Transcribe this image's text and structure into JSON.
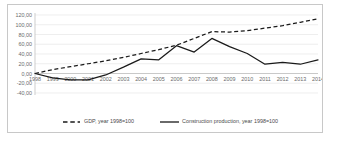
{
  "chart_data": {
    "type": "line",
    "title": "",
    "xlabel": "",
    "ylabel": "",
    "grid": true,
    "legend_position": "bottom",
    "ylim": [
      -40,
      120
    ],
    "yticks": [
      120,
      100,
      80,
      60,
      40,
      20,
      0,
      -20,
      -40
    ],
    "ytick_labels": [
      "120,00",
      "100,00",
      "80,00",
      "60,00",
      "40,00",
      "20,00",
      "0,00",
      "-20,00",
      "-40,00"
    ],
    "categories": [
      "1998",
      "1999",
      "2000",
      "2001",
      "2002",
      "2003",
      "2004",
      "2005",
      "2006",
      "2007",
      "2008",
      "2009",
      "2010",
      "2011",
      "2012",
      "2013",
      "2014"
    ],
    "series": [
      {
        "name": "GDP, year 1998=100",
        "style": "dashed",
        "color": "#1a1a1a",
        "values": [
          0,
          8,
          14,
          20,
          26,
          33,
          41,
          49,
          58,
          72,
          86,
          85,
          88,
          93,
          98,
          105,
          112
        ]
      },
      {
        "name": "Construction production, year 1998=100",
        "style": "solid",
        "color": "#1a1a1a",
        "values": [
          0,
          -9,
          -13,
          -13,
          -3,
          13,
          30,
          28,
          57,
          44,
          72,
          55,
          41,
          19,
          23,
          19,
          28
        ]
      }
    ]
  },
  "legend": {
    "entries": [
      {
        "label": "GDP, year 1998=100",
        "style": "dashed"
      },
      {
        "label": "Construction production, year 1998=100",
        "style": "solid"
      }
    ]
  }
}
